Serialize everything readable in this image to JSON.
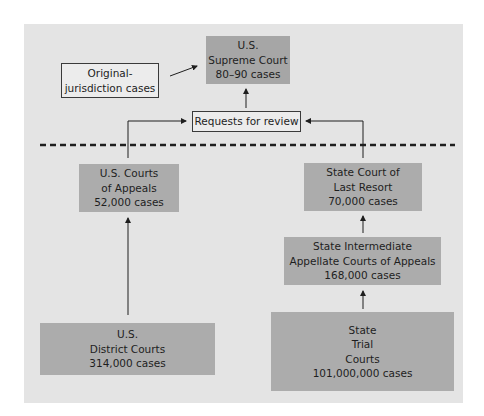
{
  "diagram": {
    "type": "flow",
    "nodes": {
      "supreme_court": {
        "lines": [
          "U.S.",
          "Supreme Court",
          "80–90 cases"
        ]
      },
      "original_jurisdiction": {
        "lines": [
          "Original-",
          "jurisdiction cases"
        ]
      },
      "requests_for_review": {
        "label": "Requests for review"
      },
      "us_courts_of_appeals": {
        "lines": [
          "U.S. Courts",
          "of Appeals",
          "52,000 cases"
        ]
      },
      "state_last_resort": {
        "lines": [
          "State Court of",
          "Last Resort",
          "70,000 cases"
        ]
      },
      "state_intermediate": {
        "lines": [
          "State Intermediate",
          "Appellate Courts of Appeals",
          "168,000 cases"
        ]
      },
      "us_district_courts": {
        "lines": [
          "U.S.",
          "District Courts",
          "314,000 cases"
        ]
      },
      "state_trial": {
        "lines": [
          "State",
          "Trial",
          "Courts",
          "101,000,000 cases"
        ]
      }
    },
    "edges": [
      {
        "from": "original_jurisdiction",
        "to": "supreme_court"
      },
      {
        "from": "requests_for_review",
        "to": "supreme_court"
      },
      {
        "from": "us_courts_of_appeals",
        "to": "requests_for_review"
      },
      {
        "from": "state_last_resort",
        "to": "requests_for_review"
      },
      {
        "from": "us_district_courts",
        "to": "us_courts_of_appeals"
      },
      {
        "from": "state_intermediate",
        "to": "state_last_resort"
      },
      {
        "from": "state_trial",
        "to": "state_intermediate"
      }
    ],
    "colors": {
      "panel": "#e4e4e4",
      "court_box": "#acacac",
      "outline_box_border": "#3a3a3a",
      "line": "#1e1e1e"
    }
  }
}
